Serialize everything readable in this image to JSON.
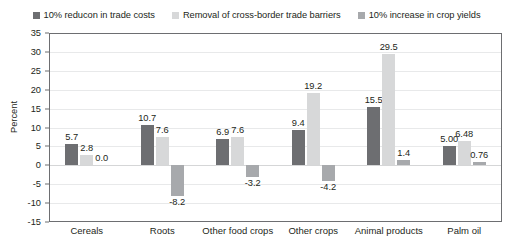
{
  "chart_data": {
    "type": "bar",
    "title": "",
    "xlabel": "",
    "ylabel": "Percent",
    "ylim": [
      -15,
      35
    ],
    "yticks": [
      35,
      30,
      25,
      20,
      15,
      10,
      5,
      0,
      -5,
      -10,
      -15
    ],
    "grid": true,
    "legend_position": "top",
    "categories": [
      "Cereals",
      "Roots",
      "Other food crops",
      "Other crops",
      "Animal products",
      "Palm oil"
    ],
    "series": [
      {
        "name": "10% reducon in trade costs",
        "color": "#6d6e71",
        "values": [
          5.7,
          10.7,
          6.9,
          9.4,
          15.5,
          5.0
        ],
        "labels": [
          "5.7",
          "10.7",
          "6.9",
          "9.4",
          "15.5",
          "5.00"
        ]
      },
      {
        "name": "Removal of cross-border trade barriers",
        "color": "#d7d8d9",
        "values": [
          2.8,
          7.6,
          7.6,
          19.2,
          29.5,
          6.48
        ],
        "labels": [
          "2.8",
          "7.6",
          "7.6",
          "19.2",
          "29.5",
          "6.48"
        ]
      },
      {
        "name": "10% increase in crop yields",
        "color": "#a7a9ac",
        "values": [
          0.0,
          -8.2,
          -3.2,
          -4.2,
          1.4,
          0.76
        ],
        "labels": [
          "0.0",
          "-8.2",
          "-3.2",
          "-4.2",
          "1.4",
          "0.76"
        ]
      }
    ]
  }
}
